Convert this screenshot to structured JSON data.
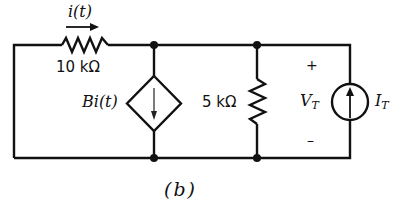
{
  "circuit": {
    "current_label": "i(t)",
    "resistor_1": {
      "value": "10 kΩ"
    },
    "dependent_source": {
      "label": "Bi(t)",
      "type": "current-controlled-current-source",
      "direction": "down"
    },
    "resistor_2": {
      "value": "5 kΩ"
    },
    "test_source": {
      "voltage_main": "V",
      "voltage_sub": "T",
      "current_main": "I",
      "current_sub": "T",
      "plus": "+",
      "minus": "–",
      "direction": "up"
    },
    "caption": "(b)"
  }
}
